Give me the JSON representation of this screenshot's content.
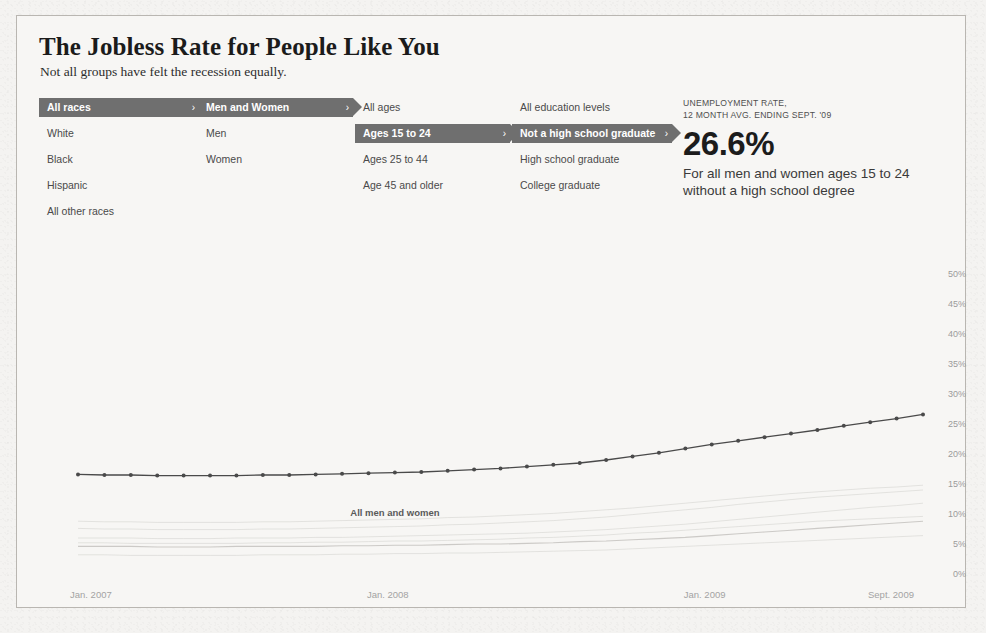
{
  "header": {
    "title": "The Jobless Rate for People Like You",
    "subtitle": "Not all groups have felt the recession equally."
  },
  "filters": {
    "race": {
      "name": "race",
      "items": [
        {
          "label": "All races",
          "selected": true
        },
        {
          "label": "White",
          "selected": false
        },
        {
          "label": "Black",
          "selected": false
        },
        {
          "label": "Hispanic",
          "selected": false
        },
        {
          "label": "All other races",
          "selected": false
        }
      ]
    },
    "gender": {
      "name": "gender",
      "items": [
        {
          "label": "Men and Women",
          "selected": true
        },
        {
          "label": "Men",
          "selected": false
        },
        {
          "label": "Women",
          "selected": false
        }
      ]
    },
    "age": {
      "name": "age",
      "items": [
        {
          "label": "All ages",
          "selected": false
        },
        {
          "label": "Ages 15 to 24",
          "selected": true
        },
        {
          "label": "Ages 25 to 44",
          "selected": false
        },
        {
          "label": "Age 45 and older",
          "selected": false
        }
      ]
    },
    "education": {
      "name": "education",
      "items": [
        {
          "label": "All education levels",
          "selected": false
        },
        {
          "label": "Not a high school graduate",
          "selected": true
        },
        {
          "label": "High school graduate",
          "selected": false
        },
        {
          "label": "College graduate",
          "selected": false
        }
      ]
    },
    "chevron_glyph": "›"
  },
  "stat": {
    "kicker_line1": "UNEMPLOYMENT RATE,",
    "kicker_line2": "12 MONTH AVG. ENDING SEPT. '09",
    "value": "26.6%",
    "description_line1": "For all men and women ages 15 to 24",
    "description_line2": "without a high school degree"
  },
  "colors": {
    "chip_background": "#6f6f6f",
    "chip_text": "#ffffff",
    "highlight_line": "#4a4a4a",
    "background_line": "#c9c7c4",
    "paper": "#f4f3f1"
  },
  "chart_data": {
    "type": "line",
    "title": "",
    "xlabel": "",
    "ylabel": "",
    "grid": false,
    "legend_position": "inline-annotation",
    "ylim": [
      0,
      50
    ],
    "yticks": [
      0,
      5,
      10,
      15,
      20,
      25,
      30,
      35,
      40,
      45,
      50
    ],
    "ytick_labels": [
      "0%",
      "5%",
      "10%",
      "15%",
      "20%",
      "25%",
      "30%",
      "35%",
      "40%",
      "45%",
      "50%"
    ],
    "xticks": [
      0,
      12,
      24,
      32
    ],
    "xtick_labels": [
      "Jan. 2007",
      "Jan. 2008",
      "Jan. 2009",
      "Sept. 2009"
    ],
    "x": [
      0,
      1,
      2,
      3,
      4,
      5,
      6,
      7,
      8,
      9,
      10,
      11,
      12,
      13,
      14,
      15,
      16,
      17,
      18,
      19,
      20,
      21,
      22,
      23,
      24,
      25,
      26,
      27,
      28,
      29,
      30,
      31,
      32
    ],
    "annotations": [
      {
        "text": "All men and women",
        "x": 12,
        "y": 9.6
      }
    ],
    "series": [
      {
        "name": "Ages 15 to 24, not a high school graduate",
        "highlighted": true,
        "markers": true,
        "values": [
          16.6,
          16.5,
          16.5,
          16.4,
          16.4,
          16.4,
          16.4,
          16.5,
          16.5,
          16.6,
          16.7,
          16.8,
          16.9,
          17.0,
          17.2,
          17.4,
          17.6,
          17.9,
          18.2,
          18.5,
          19.0,
          19.6,
          20.2,
          20.9,
          21.6,
          22.2,
          22.8,
          23.4,
          24.0,
          24.7,
          25.3,
          25.9,
          26.6
        ]
      },
      {
        "name": "All men and women",
        "highlighted": false,
        "markers": false,
        "values": [
          4.6,
          4.6,
          4.6,
          4.5,
          4.5,
          4.5,
          4.6,
          4.6,
          4.6,
          4.6,
          4.7,
          4.7,
          4.8,
          4.8,
          4.9,
          5.0,
          5.0,
          5.1,
          5.2,
          5.4,
          5.5,
          5.7,
          5.9,
          6.1,
          6.4,
          6.7,
          7.0,
          7.3,
          7.6,
          7.9,
          8.2,
          8.5,
          8.8
        ]
      },
      {
        "name": "background-trace-1",
        "highlighted": false,
        "markers": false,
        "values": [
          6.0,
          6.0,
          6.0,
          5.9,
          5.9,
          5.9,
          6.0,
          6.0,
          6.0,
          6.1,
          6.1,
          6.2,
          6.3,
          6.4,
          6.5,
          6.6,
          6.7,
          6.8,
          7.0,
          7.2,
          7.4,
          7.7,
          8.0,
          8.3,
          8.7,
          9.1,
          9.5,
          9.9,
          10.3,
          10.7,
          11.1,
          11.4,
          11.8
        ]
      },
      {
        "name": "background-trace-2",
        "highlighted": false,
        "markers": false,
        "values": [
          7.6,
          7.5,
          7.5,
          7.4,
          7.4,
          7.4,
          7.4,
          7.5,
          7.5,
          7.6,
          7.7,
          7.8,
          7.9,
          8.0,
          8.2,
          8.3,
          8.5,
          8.7,
          8.9,
          9.2,
          9.5,
          9.9,
          10.3,
          10.7,
          11.1,
          11.6,
          12.0,
          12.4,
          12.8,
          13.1,
          13.4,
          13.7,
          14.0
        ]
      },
      {
        "name": "background-trace-3",
        "highlighted": false,
        "markers": false,
        "values": [
          3.2,
          3.2,
          3.1,
          3.1,
          3.1,
          3.1,
          3.1,
          3.2,
          3.2,
          3.2,
          3.3,
          3.3,
          3.4,
          3.4,
          3.5,
          3.5,
          3.6,
          3.7,
          3.8,
          3.9,
          4.0,
          4.2,
          4.4,
          4.6,
          4.8,
          5.0,
          5.2,
          5.4,
          5.6,
          5.8,
          6.0,
          6.2,
          6.4
        ]
      },
      {
        "name": "background-trace-4",
        "highlighted": false,
        "markers": false,
        "values": [
          5.2,
          5.2,
          5.1,
          5.1,
          5.1,
          5.1,
          5.1,
          5.2,
          5.2,
          5.3,
          5.3,
          5.4,
          5.5,
          5.5,
          5.6,
          5.7,
          5.8,
          6.0,
          6.1,
          6.3,
          6.5,
          6.8,
          7.0,
          7.3,
          7.6,
          7.9,
          8.2,
          8.5,
          8.8,
          9.0,
          9.2,
          9.4,
          9.6
        ]
      },
      {
        "name": "background-trace-5",
        "highlighted": false,
        "markers": false,
        "values": [
          8.8,
          8.7,
          8.7,
          8.6,
          8.6,
          8.6,
          8.6,
          8.7,
          8.7,
          8.8,
          8.9,
          9.0,
          9.1,
          9.2,
          9.4,
          9.5,
          9.7,
          9.9,
          10.1,
          10.4,
          10.7,
          11.0,
          11.4,
          11.8,
          12.2,
          12.6,
          13.0,
          13.4,
          13.7,
          14.0,
          14.3,
          14.5,
          14.8
        ]
      }
    ]
  }
}
